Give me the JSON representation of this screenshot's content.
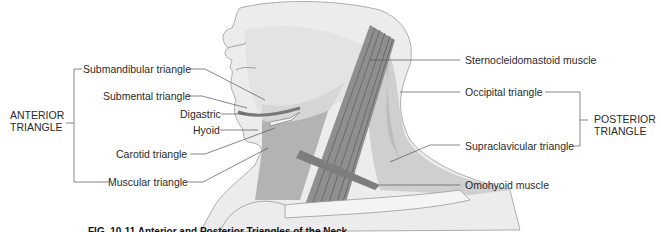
{
  "figure": {
    "anterior_group": {
      "line1": "ANTERIOR",
      "line2": "TRIANGLE"
    },
    "posterior_group": {
      "line1": "POSTERIOR",
      "line2": "TRIANGLE"
    },
    "left_labels": [
      "Submandibular triangle",
      "Submental triangle",
      "Digastric",
      "Hyoid",
      "Carotid triangle",
      "Muscular triangle"
    ],
    "right_labels": [
      "Sternocleidomastoid muscle",
      "Occipital triangle",
      "Supraclavicular triangle",
      "Omohyoid muscle"
    ],
    "caption": "FIG. 10-11  Anterior and Posterior Triangles of the Neck",
    "colors": {
      "skin": "#e4e4e4",
      "skin_light": "#efefef",
      "muscle": "#9a9a9a",
      "muscle_dark": "#7d7d7d",
      "triangle_shade": "#c4c4c4",
      "leader_line": "#555555",
      "clavicle": "#f4f4f4"
    }
  }
}
